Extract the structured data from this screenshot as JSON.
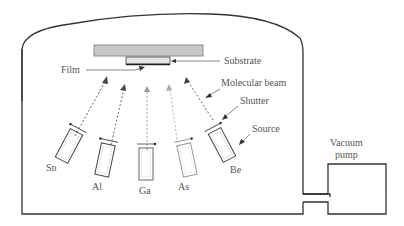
{
  "diagram": {
    "labels": {
      "substrate": "Substrate",
      "film": "Film",
      "molecular_beam": "Molecular beam",
      "shutter": "Shutter",
      "source": "Source",
      "vacuum_pump_line1": "Vacuum",
      "vacuum_pump_line2": "pump"
    },
    "sources": [
      {
        "element": "Sn",
        "shade": "dark"
      },
      {
        "element": "Al",
        "shade": "dark"
      },
      {
        "element": "Ga",
        "shade": "medium"
      },
      {
        "element": "As",
        "shade": "light"
      },
      {
        "element": "Be",
        "shade": "dark"
      }
    ],
    "colors": {
      "outline": "#333333",
      "substrate_fill": "#c8c8c8",
      "text": "#555555"
    }
  }
}
